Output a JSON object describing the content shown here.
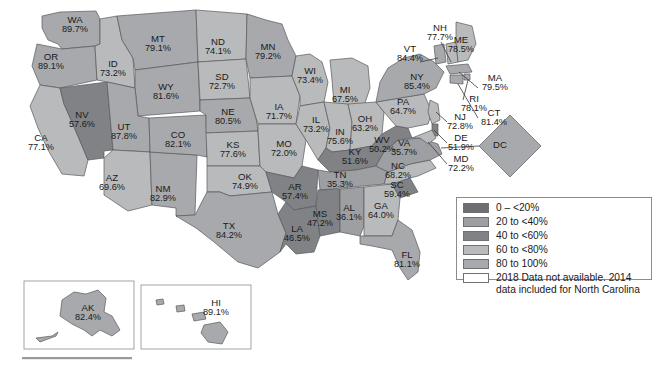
{
  "figure": {
    "type": "choropleth-map",
    "region": "United States",
    "units": "percent"
  },
  "chart_data": {
    "type": "map",
    "title": "",
    "xlabel": "",
    "ylabel": "",
    "value_suffix": "%",
    "legend_position": "bottom-right",
    "grid": false,
    "palette": {
      "bin_0_20": "#6d6e71",
      "bin_20_40": "#9d9fa2",
      "bin_40_60": "#808285",
      "bin_60_80": "#b8babc",
      "bin_80_100": "#a7a9ac",
      "no_data": "#ffffff",
      "border": "#58595b",
      "text": "#1a1a1a"
    },
    "bins": [
      {
        "label": "0 – <20%",
        "min": 0,
        "max": 20,
        "color": "#6d6e71"
      },
      {
        "label": "20 to <40%",
        "min": 20,
        "max": 40,
        "color": "#9d9fa2"
      },
      {
        "label": "40 to <60%",
        "min": 40,
        "max": 60,
        "color": "#808285"
      },
      {
        "label": "60 to <80%",
        "min": 60,
        "max": 80,
        "color": "#b8babc"
      },
      {
        "label": "80 to 100%",
        "min": 80,
        "max": 100,
        "color": "#a7a9ac"
      }
    ],
    "categories": [
      "WA",
      "OR",
      "CA",
      "NV",
      "ID",
      "MT",
      "WY",
      "UT",
      "AZ",
      "NM",
      "CO",
      "ND",
      "SD",
      "NE",
      "KS",
      "OK",
      "TX",
      "MN",
      "IA",
      "MO",
      "AR",
      "LA",
      "WI",
      "IL",
      "MI",
      "IN",
      "OH",
      "KY",
      "TN",
      "MS",
      "AL",
      "GA",
      "FL",
      "SC",
      "NC",
      "VA",
      "WV",
      "PA",
      "NY",
      "VT",
      "NH",
      "ME",
      "MA",
      "RI",
      "CT",
      "NJ",
      "DE",
      "MD",
      "DC",
      "AK",
      "HI"
    ],
    "values": [
      89.7,
      89.1,
      77.1,
      57.6,
      73.2,
      79.1,
      81.6,
      87.8,
      69.6,
      82.9,
      82.1,
      74.1,
      72.7,
      80.5,
      77.6,
      74.9,
      84.2,
      79.2,
      71.7,
      72.0,
      57.4,
      46.5,
      73.4,
      73.2,
      67.5,
      75.6,
      63.2,
      51.6,
      35.3,
      47.2,
      36.1,
      64.0,
      81.1,
      59.4,
      68.2,
      35.7,
      50.2,
      64.7,
      85.4,
      84.4,
      77.7,
      78.5,
      79.5,
      78.1,
      81.4,
      72.8,
      51.9,
      72.2,
      null,
      82.4,
      89.1
    ]
  },
  "states": [
    {
      "id": "WA",
      "abbr": "WA",
      "value": "89.7%",
      "lx": 75,
      "ly": 25
    },
    {
      "id": "OR",
      "abbr": "OR",
      "value": "89.1%",
      "lx": 51,
      "ly": 62
    },
    {
      "id": "CA",
      "abbr": "CA",
      "value": "77.1%",
      "lx": 41,
      "ly": 143
    },
    {
      "id": "NV",
      "abbr": "NV",
      "value": "57.6%",
      "lx": 82,
      "ly": 120
    },
    {
      "id": "ID",
      "abbr": "ID",
      "value": "73.2%",
      "lx": 113,
      "ly": 69
    },
    {
      "id": "MT",
      "abbr": "MT",
      "value": "79.1%",
      "lx": 158,
      "ly": 44
    },
    {
      "id": "WY",
      "abbr": "WY",
      "value": "81.6%",
      "lx": 166,
      "ly": 92
    },
    {
      "id": "UT",
      "abbr": "UT",
      "value": "87.8%",
      "lx": 124,
      "ly": 132
    },
    {
      "id": "AZ",
      "abbr": "AZ",
      "value": "69.6%",
      "lx": 112,
      "ly": 183
    },
    {
      "id": "NM",
      "abbr": "NM",
      "value": "82.9%",
      "lx": 163,
      "ly": 194
    },
    {
      "id": "CO",
      "abbr": "CO",
      "value": "82.1%",
      "lx": 178,
      "ly": 140
    },
    {
      "id": "ND",
      "abbr": "ND",
      "value": "74.1%",
      "lx": 218,
      "ly": 47
    },
    {
      "id": "SD",
      "abbr": "SD",
      "value": "72.7%",
      "lx": 222,
      "ly": 82
    },
    {
      "id": "NE",
      "abbr": "NE",
      "value": "80.5%",
      "lx": 228,
      "ly": 117
    },
    {
      "id": "KS",
      "abbr": "KS",
      "value": "77.6%",
      "lx": 233,
      "ly": 150
    },
    {
      "id": "OK",
      "abbr": "OK",
      "value": "74.9%",
      "lx": 245,
      "ly": 182
    },
    {
      "id": "TX",
      "abbr": "TX",
      "value": "84.2%",
      "lx": 229,
      "ly": 231
    },
    {
      "id": "MN",
      "abbr": "MN",
      "value": "79.2%",
      "lx": 268,
      "ly": 52
    },
    {
      "id": "IA",
      "abbr": "IA",
      "value": "71.7%",
      "lx": 279,
      "ly": 112
    },
    {
      "id": "MO",
      "abbr": "MO",
      "value": "72.0%",
      "lx": 284,
      "ly": 149
    },
    {
      "id": "AR",
      "abbr": "AR",
      "value": "57.4%",
      "lx": 295,
      "ly": 192
    },
    {
      "id": "LA",
      "abbr": "LA",
      "value": "46.5%",
      "lx": 297,
      "ly": 234
    },
    {
      "id": "WI",
      "abbr": "WI",
      "value": "73.4%",
      "lx": 310,
      "ly": 76
    },
    {
      "id": "IL",
      "abbr": "IL",
      "value": "73.2%",
      "lx": 316,
      "ly": 125
    },
    {
      "id": "MI",
      "abbr": "MI",
      "value": "67.5%",
      "lx": 345,
      "ly": 95
    },
    {
      "id": "IN",
      "abbr": "IN",
      "value": "75.6%",
      "lx": 340,
      "ly": 137
    },
    {
      "id": "OH",
      "abbr": "OH",
      "value": "63.2%",
      "lx": 365,
      "ly": 124
    },
    {
      "id": "KY",
      "abbr": "KY",
      "value": "51.6%",
      "lx": 355,
      "ly": 157
    },
    {
      "id": "TN",
      "abbr": "TN",
      "value": "35.3%",
      "lx": 340,
      "ly": 180
    },
    {
      "id": "MS",
      "abbr": "MS",
      "value": "47.2%",
      "lx": 320,
      "ly": 219
    },
    {
      "id": "AL",
      "abbr": "AL",
      "value": "36.1%",
      "lx": 349,
      "ly": 213
    },
    {
      "id": "GA",
      "abbr": "GA",
      "value": "64.0%",
      "lx": 381,
      "ly": 211
    },
    {
      "id": "FL",
      "abbr": "FL",
      "value": "81.1%",
      "lx": 407,
      "ly": 260
    },
    {
      "id": "SC",
      "abbr": "SC",
      "value": "59.4%",
      "lx": 397,
      "ly": 190
    },
    {
      "id": "NC",
      "abbr": "NC",
      "value": "68.2%",
      "lx": 398,
      "ly": 171
    },
    {
      "id": "VA",
      "abbr": "VA",
      "value": "35.7%",
      "lx": 404,
      "ly": 148
    },
    {
      "id": "WV",
      "abbr": "WV",
      "value": "50.2%",
      "lx": 382,
      "ly": 145
    },
    {
      "id": "PA",
      "abbr": "PA",
      "value": "64.7%",
      "lx": 403,
      "ly": 107
    },
    {
      "id": "NY",
      "abbr": "NY",
      "value": "85.4%",
      "lx": 417,
      "ly": 82
    },
    {
      "id": "VT",
      "abbr": "VT",
      "value": "84.4%",
      "lx": 410,
      "ly": 54
    },
    {
      "id": "NH",
      "abbr": "NH",
      "value": "77.7%",
      "lx": 440,
      "ly": 33
    },
    {
      "id": "ME",
      "abbr": "ME",
      "value": "78.5%",
      "lx": 461,
      "ly": 45
    },
    {
      "id": "MA",
      "abbr": "MA",
      "value": "79.5%",
      "lx": 495,
      "ly": 83
    },
    {
      "id": "RI",
      "abbr": "RI",
      "value": "78.1%",
      "lx": 474,
      "ly": 104
    },
    {
      "id": "CT",
      "abbr": "CT",
      "value": "81.4%",
      "lx": 494,
      "ly": 118
    },
    {
      "id": "NJ",
      "abbr": "NJ",
      "value": "72.8%",
      "lx": 460,
      "ly": 122
    },
    {
      "id": "DE",
      "abbr": "DE",
      "value": "51.9%",
      "lx": 461,
      "ly": 143
    },
    {
      "id": "MD",
      "abbr": "MD",
      "value": "72.2%",
      "lx": 461,
      "ly": 164
    },
    {
      "id": "DC",
      "abbr": "DC",
      "value": "",
      "lx": 500,
      "ly": 145
    },
    {
      "id": "AK",
      "abbr": "AK",
      "value": "82.4%",
      "lx": 88,
      "ly": 313
    },
    {
      "id": "HI",
      "abbr": "HI",
      "value": "89.1%",
      "lx": 216,
      "ly": 308
    }
  ],
  "legend": {
    "rows": [
      {
        "label": "0 – <20%",
        "color": "#6d6e71"
      },
      {
        "label": "20 to <40%",
        "color": "#9d9fa2"
      },
      {
        "label": "40 to <60%",
        "color": "#808285"
      },
      {
        "label": "60 to <80%",
        "color": "#b8babc"
      },
      {
        "label": "80 to 100%",
        "color": "#a7a9ac"
      },
      {
        "label": "2018 Data not available. 2014 data included for North Carolina",
        "color": "#ffffff"
      }
    ]
  }
}
